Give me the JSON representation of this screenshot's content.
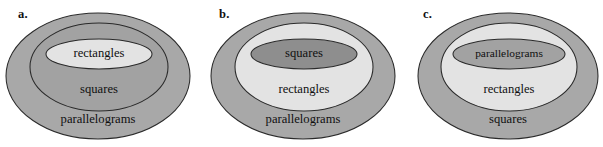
{
  "figure": {
    "width": 603,
    "height": 147,
    "background": "#ffffff",
    "type": "nested-set-diagrams",
    "caption": ""
  },
  "colors": {
    "light": "#e3e3e3",
    "medium": "#a8a8a8",
    "medium_alt": "#a2a2a2",
    "dark": "#8e8e8e",
    "darker": "#8a8a8a",
    "outline": "#2a2a2a",
    "text": "#101010",
    "page_background": "#ffffff"
  },
  "panels": [
    {
      "id": "a",
      "label": "a.",
      "label_x": 18,
      "label_y": 8,
      "rings": [
        {
          "level": "outer",
          "name": "parallelograms",
          "label": "parallelograms",
          "fill": "#a8a8a8",
          "cx": 98,
          "cy": 76,
          "rx": 92,
          "ry": 63,
          "text_x": 98,
          "text_y": 120,
          "text_size": "normal"
        },
        {
          "level": "middle",
          "name": "squares",
          "label": "squares",
          "fill": "#a2a2a2",
          "cx": 99,
          "cy": 67,
          "rx": 69,
          "ry": 44,
          "text_x": 99,
          "text_y": 90,
          "text_size": "normal"
        },
        {
          "level": "inner",
          "name": "rectangles",
          "label": "rectangles",
          "fill": "#e3e3e3",
          "cx": 99,
          "cy": 54,
          "rx": 53,
          "ry": 15,
          "text_x": 99,
          "text_y": 54,
          "text_size": "normal"
        }
      ]
    },
    {
      "id": "b",
      "label": "b.",
      "label_x": 219,
      "label_y": 8,
      "rings": [
        {
          "level": "outer",
          "name": "parallelograms",
          "label": "parallelograms",
          "fill": "#a8a8a8",
          "cx": 303,
          "cy": 76,
          "rx": 92,
          "ry": 63,
          "text_x": 303,
          "text_y": 120,
          "text_size": "normal"
        },
        {
          "level": "middle",
          "name": "rectangles",
          "label": "rectangles",
          "fill": "#e3e3e3",
          "cx": 304,
          "cy": 67,
          "rx": 69,
          "ry": 44,
          "text_x": 304,
          "text_y": 90,
          "text_size": "normal"
        },
        {
          "level": "inner",
          "name": "squares",
          "label": "squares",
          "fill": "#8e8e8e",
          "cx": 304,
          "cy": 54,
          "rx": 53,
          "ry": 15,
          "text_x": 304,
          "text_y": 54,
          "text_size": "normal"
        }
      ]
    },
    {
      "id": "c",
      "label": "c.",
      "label_x": 423,
      "label_y": 8,
      "rings": [
        {
          "level": "outer",
          "name": "squares",
          "label": "squares",
          "fill": "#a8a8a8",
          "cx": 508,
          "cy": 76,
          "rx": 90,
          "ry": 63,
          "text_x": 508,
          "text_y": 120,
          "text_size": "normal"
        },
        {
          "level": "middle",
          "name": "rectangles",
          "label": "rectangles",
          "fill": "#e3e3e3",
          "cx": 509,
          "cy": 67,
          "rx": 68,
          "ry": 44,
          "text_x": 509,
          "text_y": 90,
          "text_size": "normal"
        },
        {
          "level": "inner",
          "name": "parallelograms",
          "label": "parallelograms",
          "fill": "#a2a2a2",
          "cx": 509,
          "cy": 54,
          "rx": 56,
          "ry": 15,
          "text_x": 509,
          "text_y": 54,
          "text_size": "tiny"
        }
      ]
    }
  ]
}
